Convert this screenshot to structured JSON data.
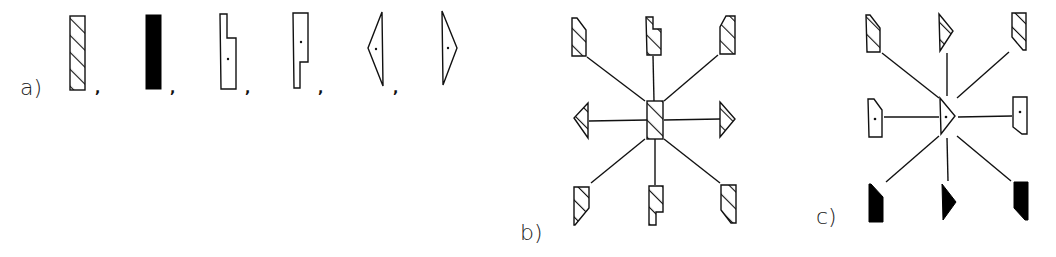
{
  "figure": {
    "panels": [
      {
        "label": "a)",
        "description": "Six element types separated by commas",
        "elements": [
          "hatched-rectangle",
          "black-rectangle",
          "notched-upper-right-with-dot",
          "notched-lower-right-with-dot",
          "left-pointing-triangle-with-dot",
          "right-pointing-triangle-with-dot"
        ],
        "separator": ","
      },
      {
        "label": "b)",
        "center": "hatched-rectangle",
        "surrounding": {
          "top_left": "hatched-trapezoid",
          "top": "hatched-notched",
          "top_right": "hatched-trapezoid",
          "left": "hatched-left-triangle",
          "right": "hatched-right-triangle",
          "bottom_left": "hatched-trapezoid",
          "bottom": "hatched-notched",
          "bottom_right": "hatched-trapezoid"
        }
      },
      {
        "label": "c)",
        "center": "right-pointing-triangle-with-dot",
        "surrounding": {
          "top_left": "hatched-trapezoid",
          "top": "hatched-right-triangle",
          "top_right": "hatched-trapezoid",
          "left": "outline-trapezoid-with-dot",
          "right": "outline-trapezoid-with-dot",
          "bottom_left": "black-trapezoid",
          "bottom": "black-right-triangle",
          "bottom_right": "black-trapezoid"
        }
      }
    ],
    "labels": {
      "a": "a)",
      "b": "b)",
      "c": "c)"
    },
    "comma": ","
  }
}
